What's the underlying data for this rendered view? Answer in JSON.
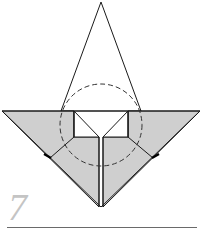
{
  "step": {
    "number": "7"
  },
  "colors": {
    "paper_fill": "#cfcfcf",
    "line": "#1a1a1a",
    "dashed_circle": "#333333",
    "step_number": "#c4c4c4",
    "rule": "#6a6a6a"
  }
}
